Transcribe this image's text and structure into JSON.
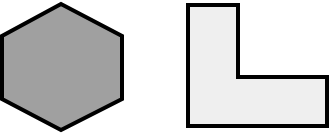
{
  "shapes": [
    {
      "name": "hexagon",
      "fill": "#a0a0a0",
      "stroke": "#000000",
      "stroke_width": 4,
      "points": "61,4 122,36 122,99 61,130 2,99 2,36"
    },
    {
      "name": "l-shape",
      "fill": "#efefef",
      "stroke": "#000000",
      "stroke_width": 4,
      "points": "188,5 238,5 238,77 327,77 327,126 188,126"
    }
  ]
}
